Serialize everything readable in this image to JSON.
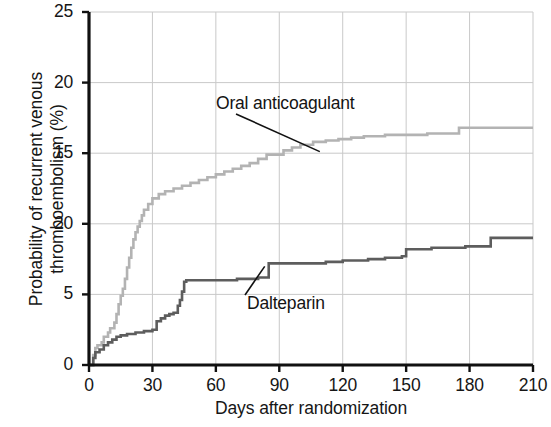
{
  "chart_data": {
    "type": "line",
    "subtype": "kaplan-meier-step",
    "title": "",
    "xlabel": "Days after randomization",
    "ylabel": "Probability of recurrent venous\nthromboembolism (%)",
    "xlim": [
      0,
      210
    ],
    "ylim": [
      0,
      25
    ],
    "xticks": [
      0,
      30,
      60,
      90,
      120,
      150,
      180,
      210
    ],
    "xtick_labels": [
      "0",
      "30",
      "60",
      "90",
      "120",
      "150",
      "180",
      "210"
    ],
    "yticks": [
      0,
      5,
      10,
      15,
      20,
      25
    ],
    "ytick_labels": [
      "0",
      "5",
      "20",
      "15",
      "20",
      "25"
    ],
    "grid": true,
    "grid_axes": "both",
    "legend": "none (inline annotations with leader lines)",
    "colors": {
      "oral_anticoagulant": "#b3b3b3",
      "dalteparin": "#5d5d5d",
      "axis": "#111111",
      "grid": "#c9c9c9",
      "background": "#ffffff"
    },
    "annotations": [
      {
        "name": "oral-anticoagulant-label",
        "text": "Oral anticoagulant",
        "points_to_day": 112,
        "points_to_value": 14.9
      },
      {
        "name": "dalteparin-label",
        "text": "Dalteparin",
        "points_to_day": 85,
        "points_to_value": 7.2
      }
    ],
    "series": [
      {
        "name": "Oral anticoagulant",
        "color": "#b3b3b3",
        "final_value": 16.8,
        "points": [
          [
            0,
            0.0
          ],
          [
            2,
            0.7
          ],
          [
            3,
            1.2
          ],
          [
            4,
            1.4
          ],
          [
            6,
            1.6
          ],
          [
            7,
            2.0
          ],
          [
            9,
            2.3
          ],
          [
            10,
            2.6
          ],
          [
            12,
            3.0
          ],
          [
            13,
            3.6
          ],
          [
            14,
            4.3
          ],
          [
            15,
            4.9
          ],
          [
            16,
            5.4
          ],
          [
            17,
            6.1
          ],
          [
            18,
            6.9
          ],
          [
            19,
            7.6
          ],
          [
            20,
            8.3
          ],
          [
            21,
            8.9
          ],
          [
            22,
            9.4
          ],
          [
            23,
            9.8
          ],
          [
            24,
            10.2
          ],
          [
            25,
            10.6
          ],
          [
            26,
            11.0
          ],
          [
            28,
            11.4
          ],
          [
            30,
            11.8
          ],
          [
            33,
            12.1
          ],
          [
            36,
            12.3
          ],
          [
            40,
            12.5
          ],
          [
            44,
            12.7
          ],
          [
            48,
            12.9
          ],
          [
            52,
            13.1
          ],
          [
            56,
            13.3
          ],
          [
            60,
            13.5
          ],
          [
            64,
            13.7
          ],
          [
            68,
            13.9
          ],
          [
            72,
            14.1
          ],
          [
            76,
            14.3
          ],
          [
            80,
            14.6
          ],
          [
            84,
            14.9
          ],
          [
            88,
            14.9
          ],
          [
            92,
            15.2
          ],
          [
            96,
            15.4
          ],
          [
            100,
            15.6
          ],
          [
            106,
            15.8
          ],
          [
            112,
            15.9
          ],
          [
            118,
            16.0
          ],
          [
            124,
            16.1
          ],
          [
            130,
            16.2
          ],
          [
            140,
            16.3
          ],
          [
            150,
            16.3
          ],
          [
            160,
            16.4
          ],
          [
            172,
            16.4
          ],
          [
            175,
            16.8
          ],
          [
            190,
            16.8
          ],
          [
            210,
            16.8
          ]
        ]
      },
      {
        "name": "Dalteparin",
        "color": "#5d5d5d",
        "final_value": 9.0,
        "points": [
          [
            0,
            0.0
          ],
          [
            2,
            0.5
          ],
          [
            3,
            0.9
          ],
          [
            5,
            1.1
          ],
          [
            7,
            1.4
          ],
          [
            9,
            1.6
          ],
          [
            11,
            1.8
          ],
          [
            13,
            2.0
          ],
          [
            15,
            2.1
          ],
          [
            18,
            2.2
          ],
          [
            22,
            2.3
          ],
          [
            26,
            2.4
          ],
          [
            30,
            2.5
          ],
          [
            32,
            3.1
          ],
          [
            34,
            3.3
          ],
          [
            36,
            3.5
          ],
          [
            38,
            3.6
          ],
          [
            40,
            3.7
          ],
          [
            42,
            4.2
          ],
          [
            43,
            4.6
          ],
          [
            44,
            5.2
          ],
          [
            45,
            5.9
          ],
          [
            46,
            6.0
          ],
          [
            60,
            6.0
          ],
          [
            70,
            6.1
          ],
          [
            80,
            6.2
          ],
          [
            85,
            7.2
          ],
          [
            100,
            7.2
          ],
          [
            112,
            7.3
          ],
          [
            120,
            7.4
          ],
          [
            132,
            7.5
          ],
          [
            140,
            7.6
          ],
          [
            148,
            7.7
          ],
          [
            150,
            8.2
          ],
          [
            162,
            8.3
          ],
          [
            168,
            8.3
          ],
          [
            178,
            8.4
          ],
          [
            188,
            8.4
          ],
          [
            190,
            9.0
          ],
          [
            200,
            9.0
          ],
          [
            210,
            9.0
          ]
        ]
      }
    ]
  }
}
